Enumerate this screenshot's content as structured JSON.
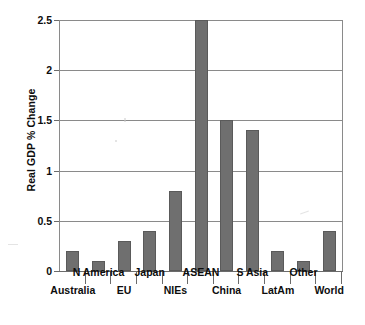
{
  "chart_data": {
    "type": "bar",
    "title": "",
    "subtitle": "",
    "xlabel": "",
    "ylabel": "Real GDP % Change",
    "categories": [
      "Australia",
      "N America",
      "EU",
      "Japan",
      "NIEs",
      "ASEAN",
      "China",
      "S Asia",
      "LatAm",
      "Other",
      "World"
    ],
    "values": [
      0.2,
      0.1,
      0.3,
      0.4,
      0.8,
      2.5,
      1.5,
      1.4,
      0.2,
      0.1,
      0.4
    ],
    "ylim": [
      0,
      2.5
    ],
    "ytick_labels": [
      "0",
      "0.5",
      "1",
      "1.5",
      "2",
      "2.5"
    ],
    "ytick_values": [
      0,
      0.5,
      1,
      1.5,
      2,
      2.5
    ],
    "grid": true,
    "legend": false,
    "legend_position": "none",
    "bar_color": "#6f6f6f",
    "bar_edge_color": "#5a5a5a",
    "axis_color": "#6b6b6b",
    "grid_color": "#8a8a8a",
    "text_color": "#0d0d0d",
    "background": "#ffffff",
    "annotations": [
      "ASEAN bar reaches the top of the axis at 2.5 and may be clipped",
      "Category labels are staggered across two rows to avoid overlap"
    ]
  }
}
